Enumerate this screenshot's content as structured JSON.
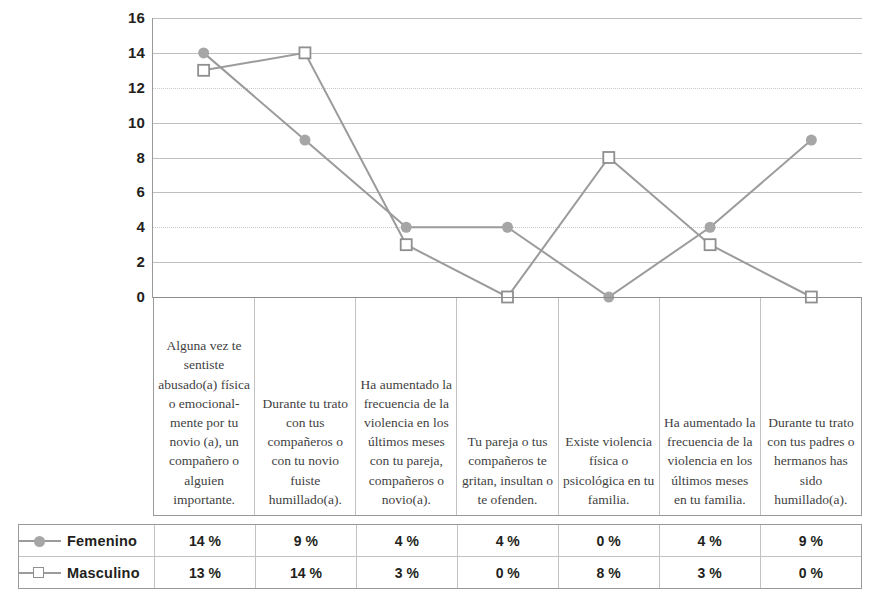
{
  "chart_data": {
    "type": "line",
    "title": "",
    "subtitle": "",
    "xlabel": "",
    "ylabel": "",
    "ylim": [
      0,
      16
    ],
    "yticks": [
      0,
      2,
      4,
      6,
      8,
      10,
      12,
      14,
      16
    ],
    "ytick_labels": [
      "0",
      "2",
      "4",
      "6",
      "8",
      "10",
      "12",
      "14",
      "16"
    ],
    "grid": true,
    "legend_position": "bottom-table",
    "value_suffix": "%",
    "categories": [
      "Alguna vez te sentiste abusado(a) física o emocional-mente por tu novio (a), un compañero o alguien importante.",
      "Durante tu trato con tus compañeros o con tu novio fuiste humillado(a).",
      "Ha aumentado la frecuencia de la violencia en los últimos meses con tu pareja, compañeros o novio(a).",
      "Tu pareja o tus compañeros te gritan, insultan o te ofenden.",
      "Existe violencia física o psicológica en tu familia.",
      "Ha aumentado la frecuencia de la violencia en los últimos meses en tu familia.",
      "Durante tu trato con tus padres o hermanos has sido humillado(a)."
    ],
    "series": [
      {
        "name": "Femenino",
        "marker": "filled-circle",
        "color": "#a6a6a6",
        "values": [
          14,
          9,
          4,
          4,
          0,
          4,
          9
        ],
        "labels": [
          "14 %",
          "9 %",
          "4 %",
          "4 %",
          "0 %",
          "4 %",
          "9 %"
        ]
      },
      {
        "name": "Masculino",
        "marker": "open-square",
        "color": "#9b9b9b",
        "values": [
          13,
          14,
          3,
          0,
          8,
          3,
          0
        ],
        "labels": [
          "13 %",
          "14 %",
          "3 %",
          "0 %",
          "8 %",
          "3 %",
          "0 %"
        ]
      }
    ]
  },
  "colors": {
    "femenino_marker": "#a6a6a6",
    "masculino_marker": "#8f8f8f",
    "line": "#9b9b9b",
    "gridline": "#bfbfbf",
    "axis": "#9a9a9a",
    "text": "#231f20",
    "category_text": "#3f3f3f"
  }
}
